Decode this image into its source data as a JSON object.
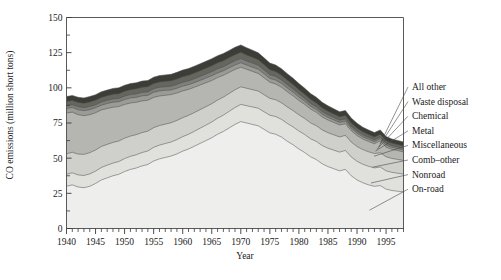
{
  "chart_data": {
    "type": "area",
    "stacked": true,
    "title": "",
    "xlabel": "Year",
    "ylabel": "CO emissions (million short tons)",
    "xlim": [
      1940,
      1998
    ],
    "ylim": [
      0,
      150
    ],
    "ytick_labels": [
      "0",
      "25",
      "50",
      "75",
      "100",
      "125",
      "150"
    ],
    "ytick_values": [
      0,
      25,
      50,
      75,
      100,
      125,
      150
    ],
    "ytick_minor_step": 12.5,
    "xtick_labels": [
      "1940",
      "1945",
      "1950",
      "1955",
      "1960",
      "1965",
      "1970",
      "1975",
      "1980",
      "1985",
      "1990",
      "1995"
    ],
    "xtick_values": [
      1940,
      1945,
      1950,
      1955,
      1960,
      1965,
      1970,
      1975,
      1980,
      1985,
      1990,
      1995
    ],
    "xtick_minor_step": 1,
    "grid": false,
    "legend_position": "right-leader-lines",
    "x": [
      1940,
      1941,
      1942,
      1943,
      1944,
      1945,
      1946,
      1947,
      1948,
      1949,
      1950,
      1951,
      1952,
      1953,
      1954,
      1955,
      1956,
      1957,
      1958,
      1959,
      1960,
      1961,
      1962,
      1963,
      1964,
      1965,
      1966,
      1967,
      1968,
      1969,
      1970,
      1971,
      1972,
      1973,
      1974,
      1975,
      1976,
      1977,
      1978,
      1979,
      1980,
      1981,
      1982,
      1983,
      1984,
      1985,
      1986,
      1987,
      1988,
      1989,
      1990,
      1991,
      1992,
      1993,
      1994,
      1995,
      1996,
      1997,
      1998
    ],
    "series": [
      {
        "name": "On-road",
        "color": "#eeeeec",
        "values": [
          30.1,
          31.0,
          29.5,
          29.0,
          30.0,
          32.0,
          34.5,
          36.0,
          37.5,
          38.5,
          40.5,
          42.0,
          43.0,
          44.5,
          45.5,
          48.0,
          49.5,
          50.5,
          51.5,
          53.0,
          55.0,
          56.5,
          58.5,
          60.5,
          62.5,
          64.5,
          67.0,
          69.0,
          71.5,
          74.0,
          76.0,
          75.0,
          74.0,
          73.0,
          70.5,
          68.0,
          67.0,
          65.0,
          62.0,
          59.5,
          56.5,
          54.0,
          51.0,
          49.0,
          46.0,
          44.0,
          42.5,
          41.0,
          42.0,
          37.5,
          34.5,
          32.5,
          31.0,
          30.0,
          30.5,
          28.0,
          27.0,
          26.5,
          26.0
        ]
      },
      {
        "name": "Nonroad",
        "color": "#e0e0dd",
        "values": [
          8.5,
          8.6,
          8.6,
          8.7,
          8.8,
          8.8,
          8.9,
          9.0,
          9.0,
          9.1,
          9.2,
          9.3,
          9.4,
          9.5,
          9.6,
          9.7,
          9.8,
          9.9,
          10.0,
          10.2,
          10.3,
          10.5,
          10.6,
          10.8,
          11.0,
          11.2,
          11.4,
          11.6,
          11.8,
          12.0,
          12.2,
          12.3,
          12.4,
          12.5,
          12.5,
          12.5,
          12.6,
          12.6,
          12.7,
          12.7,
          12.8,
          12.8,
          12.8,
          12.9,
          13.0,
          13.1,
          13.2,
          13.3,
          13.5,
          13.4,
          13.3,
          13.2,
          13.2,
          13.1,
          13.2,
          13.0,
          12.9,
          12.8,
          12.7
        ]
      },
      {
        "name": "Comb–other",
        "color": "#cfcfcb",
        "values": [
          14.5,
          14.6,
          14.8,
          15.0,
          15.1,
          15.0,
          14.9,
          14.8,
          14.7,
          14.6,
          14.5,
          14.4,
          14.3,
          14.2,
          14.1,
          14.0,
          13.9,
          13.8,
          13.7,
          13.6,
          13.5,
          13.4,
          13.3,
          13.2,
          13.1,
          13.0,
          12.9,
          12.8,
          12.7,
          12.6,
          12.5,
          12.4,
          12.3,
          12.2,
          12.1,
          12.0,
          11.9,
          11.8,
          11.7,
          11.6,
          11.5,
          11.4,
          11.3,
          11.2,
          11.1,
          11.0,
          10.9,
          10.8,
          10.7,
          10.6,
          10.5,
          10.4,
          10.3,
          10.2,
          10.1,
          10.0,
          9.9,
          9.8,
          9.7
        ]
      },
      {
        "name": "Miscellaneous",
        "color": "#b5b5b1",
        "values": [
          29.0,
          28.5,
          28.0,
          27.5,
          27.0,
          26.5,
          26.0,
          25.5,
          25.0,
          24.5,
          24.0,
          23.5,
          23.0,
          22.5,
          22.0,
          21.5,
          21.0,
          20.5,
          20.0,
          19.5,
          19.0,
          18.5,
          18.0,
          17.5,
          17.0,
          16.5,
          16.0,
          15.5,
          15.0,
          14.5,
          14.0,
          13.5,
          13.0,
          12.5,
          12.0,
          11.5,
          11.2,
          11.0,
          10.8,
          10.5,
          10.2,
          10.0,
          9.8,
          9.5,
          9.2,
          9.0,
          8.8,
          8.5,
          8.3,
          8.0,
          7.8,
          7.5,
          7.3,
          7.0,
          8.5,
          6.8,
          6.5,
          6.3,
          6.0
        ]
      },
      {
        "name": "Metal",
        "color": "#9a9a96",
        "values": [
          3.2,
          3.3,
          3.5,
          3.6,
          3.6,
          3.5,
          3.4,
          3.5,
          3.6,
          3.4,
          3.5,
          3.6,
          3.5,
          3.6,
          3.4,
          3.6,
          3.6,
          3.5,
          3.3,
          3.4,
          3.4,
          3.3,
          3.3,
          3.3,
          3.4,
          3.4,
          3.3,
          3.2,
          3.2,
          3.1,
          3.1,
          3.0,
          3.0,
          3.0,
          2.9,
          2.7,
          2.8,
          2.7,
          2.6,
          2.6,
          2.4,
          2.2,
          2.0,
          2.0,
          2.0,
          1.9,
          1.8,
          1.8,
          1.8,
          1.7,
          1.7,
          1.6,
          1.6,
          1.5,
          1.5,
          1.5,
          1.4,
          1.4,
          1.4
        ]
      },
      {
        "name": "Chemical",
        "color": "#7f7f7b",
        "values": [
          2.0,
          2.0,
          2.1,
          2.1,
          2.2,
          2.2,
          2.2,
          2.3,
          2.3,
          2.3,
          2.4,
          2.4,
          2.5,
          2.5,
          2.5,
          2.6,
          2.6,
          2.6,
          2.6,
          2.7,
          2.7,
          2.7,
          2.8,
          2.8,
          2.8,
          2.9,
          2.9,
          2.9,
          2.9,
          3.0,
          3.0,
          2.9,
          2.9,
          2.8,
          2.7,
          2.6,
          2.6,
          2.5,
          2.4,
          2.3,
          2.2,
          2.1,
          2.0,
          1.9,
          1.8,
          1.8,
          1.7,
          1.6,
          1.6,
          1.5,
          1.5,
          1.4,
          1.4,
          1.3,
          1.3,
          1.3,
          1.2,
          1.2,
          1.2
        ]
      },
      {
        "name": "Waste disposal",
        "color": "#66665f",
        "values": [
          3.0,
          3.0,
          3.1,
          3.1,
          3.2,
          3.2,
          3.3,
          3.3,
          3.4,
          3.4,
          3.5,
          3.5,
          3.6,
          3.6,
          3.7,
          3.7,
          3.8,
          3.8,
          3.9,
          3.9,
          4.0,
          4.0,
          4.1,
          4.1,
          4.2,
          4.2,
          4.3,
          4.3,
          4.4,
          4.4,
          4.5,
          4.3,
          4.2,
          4.0,
          3.8,
          3.6,
          3.5,
          3.4,
          3.3,
          3.2,
          3.1,
          3.0,
          2.9,
          2.8,
          2.7,
          2.6,
          2.5,
          2.4,
          2.4,
          2.3,
          2.2,
          2.1,
          2.0,
          2.0,
          1.9,
          1.8,
          1.8,
          1.7,
          1.7
        ]
      },
      {
        "name": "All other",
        "color": "#3d3d38",
        "values": [
          3.5,
          3.6,
          3.7,
          3.8,
          3.9,
          3.9,
          4.0,
          4.0,
          4.1,
          4.2,
          4.2,
          4.3,
          4.3,
          4.4,
          4.4,
          4.5,
          4.5,
          4.6,
          4.6,
          4.7,
          4.7,
          4.8,
          4.8,
          4.9,
          4.9,
          5.0,
          5.0,
          5.1,
          5.1,
          5.2,
          5.2,
          5.1,
          5.0,
          4.9,
          4.8,
          4.7,
          4.6,
          4.6,
          4.5,
          4.4,
          4.3,
          4.2,
          4.1,
          4.0,
          3.9,
          3.8,
          3.7,
          3.6,
          3.6,
          3.5,
          3.4,
          3.3,
          3.2,
          3.1,
          3.1,
          3.0,
          2.9,
          2.9,
          2.8
        ]
      }
    ]
  },
  "legend": {
    "items": [
      {
        "label": "All other"
      },
      {
        "label": "Waste disposal"
      },
      {
        "label": "Chemical"
      },
      {
        "label": "Metal"
      },
      {
        "label": "Miscellaneous"
      },
      {
        "label": "Comb–other"
      },
      {
        "label": "Nonroad"
      },
      {
        "label": "On-road"
      }
    ]
  }
}
